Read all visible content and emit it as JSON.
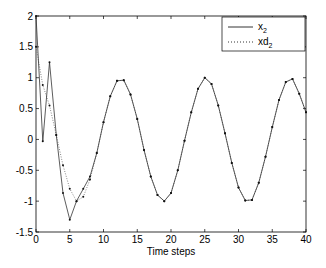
{
  "chart_data": {
    "type": "line",
    "title": "",
    "xlabel": "Time steps",
    "ylabel": "",
    "xlim": [
      0,
      40
    ],
    "ylim": [
      -1.5,
      2
    ],
    "xticks": [
      0,
      5,
      10,
      15,
      20,
      25,
      30,
      35,
      40
    ],
    "yticks": [
      -1.5,
      -1,
      -0.5,
      0,
      0.5,
      1,
      1.5,
      2
    ],
    "xtick_labels": [
      "0",
      "5",
      "10",
      "15",
      "20",
      "25",
      "30",
      "35",
      "40"
    ],
    "ytick_labels": [
      "-1.5",
      "-1",
      "-0.5",
      "0",
      "0.5",
      "1",
      "1.5",
      "2"
    ],
    "grid": false,
    "legend_position": "upper right",
    "x": [
      0,
      1,
      2,
      3,
      4,
      5,
      6,
      7,
      8,
      9,
      10,
      11,
      12,
      13,
      14,
      15,
      16,
      17,
      18,
      19,
      20,
      21,
      22,
      23,
      24,
      25,
      26,
      27,
      28,
      29,
      30,
      31,
      32,
      33,
      34,
      35,
      36,
      37,
      38,
      39,
      40
    ],
    "series": [
      {
        "name": "x_2",
        "style": "solid",
        "color": "#000000",
        "values": [
          2.0,
          -0.03,
          1.25,
          0.07,
          -0.87,
          -1.3,
          -1.0,
          -0.8,
          -0.6,
          -0.22,
          0.28,
          0.7,
          0.95,
          0.96,
          0.73,
          0.33,
          -0.17,
          -0.6,
          -0.9,
          -1.0,
          -0.87,
          -0.5,
          -0.02,
          0.44,
          0.82,
          1.0,
          0.9,
          0.55,
          0.1,
          -0.38,
          -0.78,
          -0.99,
          -0.98,
          -0.7,
          -0.28,
          0.2,
          0.64,
          0.93,
          0.98,
          0.74,
          0.44
        ]
      },
      {
        "name": "xd_2",
        "style": "dotted",
        "color": "#000000",
        "values": [
          1.5,
          0.88,
          0.55,
          0.07,
          -0.42,
          -0.8,
          -1.0,
          -0.93,
          -0.65,
          -0.22,
          0.28,
          0.7,
          0.95,
          0.96,
          0.73,
          0.33,
          -0.17,
          -0.6,
          -0.9,
          -1.0,
          -0.87,
          -0.5,
          -0.02,
          0.44,
          0.82,
          1.0,
          0.9,
          0.55,
          0.1,
          -0.38,
          -0.78,
          -0.99,
          -0.98,
          -0.7,
          -0.28,
          0.2,
          0.64,
          0.93,
          0.98,
          0.74,
          0.44
        ]
      }
    ]
  },
  "legend": {
    "items": [
      {
        "base": "x",
        "sub": "2",
        "style": "solid"
      },
      {
        "base": "xd",
        "sub": "2",
        "style": "dotted"
      }
    ]
  }
}
